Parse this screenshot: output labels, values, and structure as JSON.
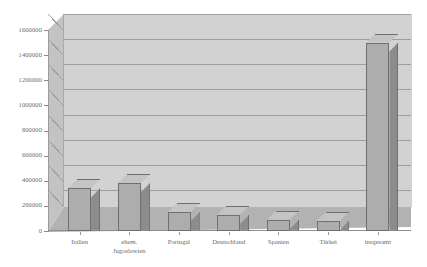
{
  "chart_data": {
    "type": "bar",
    "title": "",
    "subtitle": "",
    "xlabel": "",
    "ylabel": "",
    "categories": [
      "Italien",
      "ehem. Jugoslawien",
      "Portugal",
      "Deutschland",
      "Spanien",
      "Türkei",
      "insgesamt"
    ],
    "category_lines": [
      [
        "Italien"
      ],
      [
        "ehem.",
        "Jugoslawien"
      ],
      [
        "Portugal"
      ],
      [
        "Deutschland"
      ],
      [
        "Spanien"
      ],
      [
        "Türkei"
      ],
      [
        "insgesamt"
      ]
    ],
    "values": [
      340000,
      380000,
      150000,
      130000,
      90000,
      80000,
      1500000
    ],
    "ylim": [
      0,
      1600000
    ],
    "ytick_values": [
      0,
      200000,
      400000,
      600000,
      800000,
      1000000,
      1200000,
      1400000,
      1600000
    ],
    "ytick_labels": [
      "0",
      "200000",
      "400000",
      "600000",
      "800000",
      "1000000",
      "1200000",
      "1400000",
      "1600000"
    ],
    "grid": true,
    "legend": null,
    "legend_position": "none",
    "style": "3d-column",
    "colors": {
      "bar_front": "#adadad",
      "bar_side": "#8c8c8c",
      "bar_top": "#c4c4c4",
      "bar_outline": "#6f6f6f",
      "back_wall": "#d2d2d2",
      "left_wall": "#c3c3c3",
      "floor": "#b2b2b2",
      "gridline": "#9e9e9e",
      "text": "#6a6a6a",
      "background": "#ffffff"
    }
  }
}
